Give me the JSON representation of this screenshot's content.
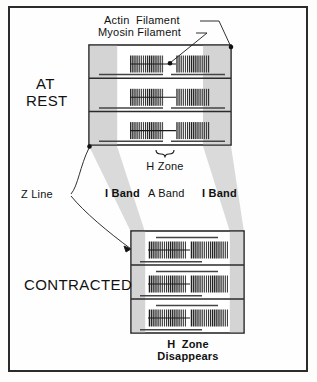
{
  "figure": {
    "background": "#fefefe",
    "frame_color": "#2b2b2b"
  },
  "colors": {
    "ink": "#111111",
    "filament": "#1a1a1a",
    "i_band_shade": "#d2d2d2",
    "projection_shade": "#d9d9d9",
    "block_fill": "#ffffff",
    "outline": "#2b2b2b"
  },
  "leader_labels": {
    "actin": "Actin  Filament",
    "myosin": "Myosin Filament"
  },
  "states": {
    "rest": "AT\nREST",
    "rest_line1": "AT",
    "rest_line2": "REST",
    "contracted": "CONTRACTED"
  },
  "bands": {
    "i_band_left": "I Band",
    "a_band": "A Band",
    "i_band_right": "I Band",
    "h_zone": "H Zone",
    "z_line": "Z Line"
  },
  "contracted_note": {
    "line1": "H  Zone",
    "line2": "Disappears"
  },
  "rest_sarcomere": {
    "rows": 3,
    "myofibril_x": 89,
    "myofibril_y": 45,
    "myofibril_width": 142,
    "myofibril_height": 100,
    "i_band_left_width": 28,
    "i_band_right_width": 28,
    "h_zone_gap": 14,
    "myosin_segment_width": 34,
    "striation_count": 16
  },
  "contracted_sarcomere": {
    "rows": 3,
    "myofibril_x": 131,
    "myofibril_y": 231,
    "myofibril_width": 113,
    "myofibril_height": 102,
    "i_band_left_width": 14,
    "i_band_right_width": 14,
    "h_zone_gap": 2,
    "myosin_segment_width": 38,
    "striation_count": 18
  }
}
